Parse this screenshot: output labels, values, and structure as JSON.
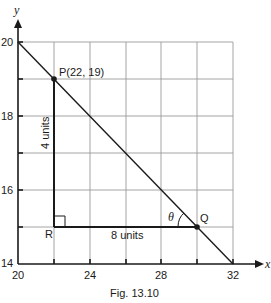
{
  "figure": {
    "caption": "Fig. 13.10",
    "x_axis": {
      "label": "x",
      "ticks": [
        "20",
        "24",
        "28",
        "32"
      ],
      "range": [
        20,
        32
      ],
      "grid_step": 2
    },
    "y_axis": {
      "label": "y",
      "ticks": [
        "20",
        "18",
        "16",
        "14"
      ],
      "range": [
        14,
        20
      ],
      "grid_step": 1
    },
    "points": {
      "P": {
        "label": "P(22, 19)",
        "x": 22,
        "y": 19
      },
      "Q": {
        "label": "Q",
        "x": 30,
        "y": 15
      },
      "R": {
        "label": "R",
        "x": 22,
        "y": 15
      }
    },
    "line": {
      "from": [
        20,
        20
      ],
      "to": [
        32,
        14
      ]
    },
    "annotations": {
      "vertical_length": "4 units",
      "horizontal_length": "8 units",
      "angle": "θ"
    }
  }
}
